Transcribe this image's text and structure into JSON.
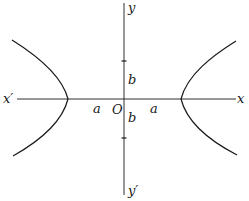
{
  "diagram": {
    "type": "hyperbola",
    "stroke_color": "#1a1a1a",
    "labels": {
      "x_axis_pos": "x",
      "x_axis_neg": "x′",
      "y_axis_pos": "y",
      "y_axis_neg": "y′",
      "origin": "O",
      "semi_major_left": "a",
      "semi_major_right": "a",
      "semi_minor_top": "b",
      "semi_minor_bottom": "b"
    }
  }
}
